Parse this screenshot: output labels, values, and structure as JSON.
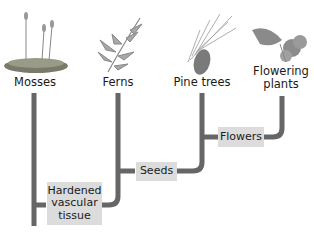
{
  "diagram": {
    "type": "cladogram",
    "colors": {
      "line": "#666666",
      "trait_box": "#dcdcdc",
      "text": "#1a1a1a"
    },
    "taxa": [
      {
        "label": "Mosses",
        "icon": "moss-illustration"
      },
      {
        "label": "Ferns",
        "icon": "fern-illustration"
      },
      {
        "label": "Pine trees",
        "icon": "pine-branch-illustration"
      },
      {
        "label": "Flowering plants",
        "icon": "flower-illustration"
      }
    ],
    "traits": [
      {
        "label": "Hardened vascular tissue"
      },
      {
        "label": "Seeds"
      },
      {
        "label": "Flowers"
      }
    ]
  }
}
